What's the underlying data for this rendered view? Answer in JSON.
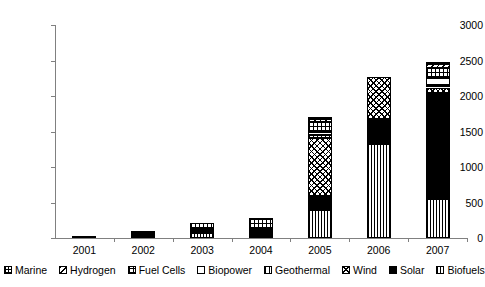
{
  "chart_data": {
    "type": "bar",
    "subtype": "stacked-vertical",
    "title": "",
    "xlabel": "",
    "ylabel": "",
    "ylim": [
      0,
      3000
    ],
    "ytick_step": 500,
    "yticks": [
      "3000",
      "2500",
      "2000",
      "1500",
      "1000",
      "500",
      "0"
    ],
    "grid": false,
    "legend_position": "bottom",
    "categories": [
      "2001",
      "2002",
      "2003",
      "2004",
      "2005",
      "2006",
      "2007"
    ],
    "series": [
      {
        "name": "Biofuels",
        "pattern": "fine-vertical-stripes",
        "values": [
          0,
          20,
          70,
          0,
          390,
          1330,
          555
        ]
      },
      {
        "name": "Solar",
        "pattern": "solid-black",
        "values": [
          35,
          45,
          55,
          120,
          205,
          350,
          1490
        ]
      },
      {
        "name": "Wind",
        "pattern": "checkerboard",
        "values": [
          0,
          0,
          0,
          0,
          820,
          590,
          75
        ]
      },
      {
        "name": "Geothermal",
        "pattern": "medium-vertical-stripes",
        "values": [
          0,
          0,
          0,
          0,
          35,
          0,
          30
        ]
      },
      {
        "name": "Biopower",
        "pattern": "white-empty",
        "values": [
          0,
          0,
          0,
          0,
          50,
          0,
          110
        ]
      },
      {
        "name": "Fuel Cells",
        "pattern": "small-grid",
        "values": [
          0,
          20,
          80,
          155,
          135,
          0,
          130
        ]
      },
      {
        "name": "Hydrogen",
        "pattern": "diagonal-hatch",
        "values": [
          0,
          0,
          0,
          0,
          45,
          0,
          65
        ]
      },
      {
        "name": "Marine",
        "pattern": "dense-cross",
        "values": [
          0,
          0,
          0,
          0,
          15,
          0,
          10
        ]
      }
    ],
    "totals": [
      35,
      85,
      205,
      275,
      1695,
      2270,
      2465
    ]
  },
  "legend": {
    "items": [
      {
        "label": "Marine",
        "swatch": "marine-swatch-icon"
      },
      {
        "label": "Hydrogen",
        "swatch": "hydrogen-swatch-icon"
      },
      {
        "label": "Fuel Cells",
        "swatch": "fuel-cells-swatch-icon"
      },
      {
        "label": "Biopower",
        "swatch": "biopower-swatch-icon"
      },
      {
        "label": "Geothermal",
        "swatch": "geothermal-swatch-icon"
      },
      {
        "label": "Wind",
        "swatch": "wind-swatch-icon"
      },
      {
        "label": "Solar",
        "swatch": "solar-swatch-icon"
      },
      {
        "label": "Biofuels",
        "swatch": "biofuels-swatch-icon"
      }
    ]
  },
  "axes": {
    "y_labels": [
      "3000",
      "2500",
      "2000",
      "1500",
      "1000",
      "500",
      "0"
    ],
    "x_labels": [
      "2001",
      "2002",
      "2003",
      "2004",
      "2005",
      "2006",
      "2007"
    ]
  },
  "colors": {
    "axis": "#808080",
    "ink": "#000000",
    "background": "#ffffff"
  }
}
